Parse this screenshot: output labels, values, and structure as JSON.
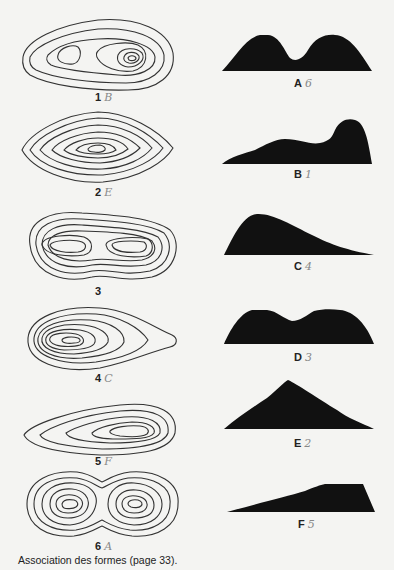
{
  "title": "Association des formes",
  "caption": "Association des formes (page 33).",
  "contour_maps": [
    {
      "number": "1",
      "annotation": "B",
      "description": "elongated hill with two summits, right one higher"
    },
    {
      "number": "2",
      "annotation": "E",
      "description": "single central peak, diamond-shaped contours"
    },
    {
      "number": "3",
      "annotation": "",
      "description": "two equal summits, broad saddle"
    },
    {
      "number": "4",
      "annotation": "C",
      "description": "steep summit on left, gentle slope to right"
    },
    {
      "number": "5",
      "annotation": "F",
      "description": "long gentle slope rising to right summit"
    },
    {
      "number": "6",
      "annotation": "A",
      "description": "two equal rounded summits, deep saddle"
    }
  ],
  "profiles": [
    {
      "letter": "A",
      "annotation": "6"
    },
    {
      "letter": "B",
      "annotation": "1"
    },
    {
      "letter": "C",
      "annotation": "4"
    },
    {
      "letter": "D",
      "annotation": "3"
    },
    {
      "letter": "E",
      "annotation": "2"
    },
    {
      "letter": "F",
      "annotation": "5"
    }
  ]
}
